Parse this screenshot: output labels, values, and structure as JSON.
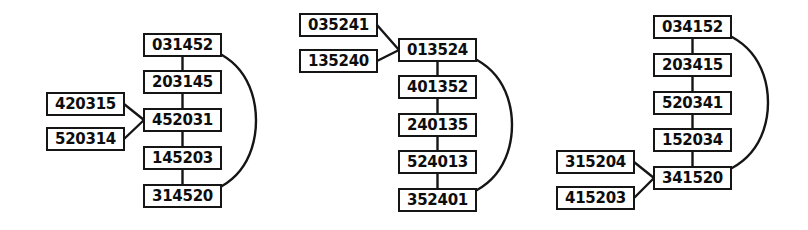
{
  "diagram": {
    "type": "permutation-lattice-diagram",
    "background_color": "#ffffff",
    "node_border_color": "#151515",
    "node_fill_color": "#ffffff",
    "node_text_color": "#0d0d0d",
    "edge_color": "#151515",
    "groups": [
      {
        "id": "group-left",
        "chain": [
          {
            "id": "L1",
            "label": "031452",
            "x": 143,
            "y": 33,
            "w": 79,
            "h": 24
          },
          {
            "id": "L2",
            "label": "203145",
            "x": 143,
            "y": 70,
            "w": 79,
            "h": 24
          },
          {
            "id": "L3",
            "label": "452031",
            "x": 143,
            "y": 108,
            "w": 79,
            "h": 24
          },
          {
            "id": "L4",
            "label": "145203",
            "x": 143,
            "y": 146,
            "w": 79,
            "h": 24
          },
          {
            "id": "L5",
            "label": "314520",
            "x": 143,
            "y": 184,
            "w": 79,
            "h": 24
          }
        ],
        "inputs": [
          {
            "id": "L-in1",
            "label": "420315",
            "x": 46,
            "y": 92,
            "w": 79,
            "h": 24
          },
          {
            "id": "L-in2",
            "label": "520314",
            "x": 46,
            "y": 127,
            "w": 79,
            "h": 24
          }
        ],
        "input_target": "L3",
        "arc": {
          "from": "L1",
          "to": "L5",
          "bulge_x": 256
        }
      },
      {
        "id": "group-middle",
        "chain": [
          {
            "id": "M1",
            "label": "013524",
            "x": 398,
            "y": 38,
            "w": 79,
            "h": 24
          },
          {
            "id": "M2",
            "label": "401352",
            "x": 398,
            "y": 75,
            "w": 79,
            "h": 24
          },
          {
            "id": "M3",
            "label": "240135",
            "x": 398,
            "y": 113,
            "w": 79,
            "h": 24
          },
          {
            "id": "M4",
            "label": "524013",
            "x": 398,
            "y": 150,
            "w": 79,
            "h": 24
          },
          {
            "id": "M5",
            "label": "352401",
            "x": 398,
            "y": 188,
            "w": 79,
            "h": 24
          }
        ],
        "inputs": [
          {
            "id": "M-in1",
            "label": "035241",
            "x": 299,
            "y": 13,
            "w": 79,
            "h": 24
          },
          {
            "id": "M-in2",
            "label": "135240",
            "x": 299,
            "y": 49,
            "w": 79,
            "h": 24
          }
        ],
        "input_target": "M1",
        "arc": {
          "from": "M1",
          "to": "M5",
          "bulge_x": 512
        }
      },
      {
        "id": "group-right",
        "chain": [
          {
            "id": "R1",
            "label": "034152",
            "x": 653,
            "y": 15,
            "w": 79,
            "h": 24
          },
          {
            "id": "R2",
            "label": "203415",
            "x": 653,
            "y": 53,
            "w": 79,
            "h": 24
          },
          {
            "id": "R3",
            "label": "520341",
            "x": 653,
            "y": 91,
            "w": 79,
            "h": 24
          },
          {
            "id": "R4",
            "label": "152034",
            "x": 653,
            "y": 128,
            "w": 79,
            "h": 24
          },
          {
            "id": "R5",
            "label": "341520",
            "x": 653,
            "y": 166,
            "w": 79,
            "h": 24
          }
        ],
        "inputs": [
          {
            "id": "R-in1",
            "label": "315204",
            "x": 556,
            "y": 150,
            "w": 79,
            "h": 24
          },
          {
            "id": "R-in2",
            "label": "415203",
            "x": 556,
            "y": 186,
            "w": 79,
            "h": 24
          }
        ],
        "input_target": "R5",
        "arc": {
          "from": "R1",
          "to": "R5",
          "bulge_x": 768
        }
      }
    ]
  }
}
